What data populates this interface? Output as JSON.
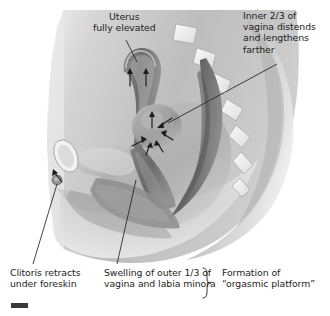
{
  "figure": {
    "kind": "medical-illustration",
    "style": "grayscale-airbrush",
    "background_color": "#ffffff",
    "body_tone_light": "#d8d8d8",
    "body_tone_mid": "#a8a8a8",
    "body_tone_dark": "#6f6f6f",
    "organ_dark": "#595959",
    "organ_mid": "#8a8a8a",
    "organ_light": "#cfcfcf",
    "outline_color": "#4a4a4a",
    "leader_line_color": "#2b2b2b",
    "text_color": "#1c1c1c"
  },
  "labels": {
    "uterus": {
      "lines": [
        "Uterus",
        "fully elevated"
      ],
      "text": "Uterus\nfully elevated",
      "align": "center"
    },
    "inner_vagina": {
      "lines": [
        "Inner 2/3 of",
        "vagina distends",
        "and lengthens",
        "farther"
      ],
      "text": "Inner 2/3 of\nvagina distends\nand lengthens\nfarther",
      "align": "left"
    },
    "clitoris": {
      "lines": [
        "Clitoris retracts",
        "under foreskin"
      ],
      "text": "Clitoris retracts\nunder foreskin",
      "align": "left"
    },
    "swelling": {
      "lines": [
        "Swelling of outer 1/3 of",
        "vagina and labia minora"
      ],
      "text": "Swelling of outer 1/3 of\nvagina and labia minora",
      "align": "left"
    },
    "formation": {
      "lines": [
        "Formation of",
        "“orgasmic platform”"
      ],
      "text": "Formation of\n“orgasmic platform”",
      "align": "left"
    }
  },
  "anatomy": {
    "structures": [
      "uterus",
      "vaginal-canal",
      "bladder",
      "pubic-bone",
      "rectum",
      "sacrum-vertebrae",
      "clitoris",
      "labia",
      "perineum",
      "abdominal-wall",
      "buttock"
    ]
  },
  "annotations": {
    "brace": "}",
    "arrow_count_uterus": 3,
    "arrow_count_platform": 6,
    "arrow_count_clitoris": 1
  }
}
